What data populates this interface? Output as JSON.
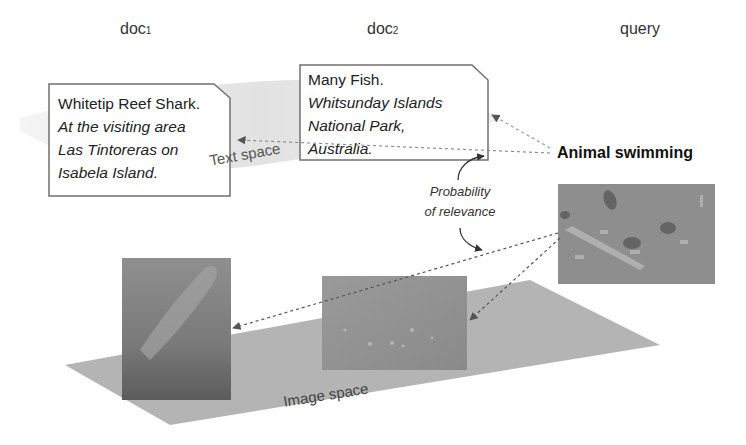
{
  "columns": {
    "doc1": {
      "label": "doc",
      "subscript": "1"
    },
    "doc2": {
      "label": "doc",
      "subscript": "2"
    },
    "query": {
      "label": "query"
    }
  },
  "doc1": {
    "title": "Whitetip Reef Shark.",
    "description_lines": [
      "At the visiting area",
      "Las Tintoreras on",
      "Isabela Island."
    ],
    "image": "shark-underwater-photo"
  },
  "doc2": {
    "title": "Many Fish.",
    "description_lines": [
      "Whitsunday Islands",
      "National Park,",
      "Australia."
    ],
    "image": "many-fish-underwater-photo"
  },
  "query": {
    "text": "Animal swimming",
    "image": "fish-swimming-photo"
  },
  "labels": {
    "text_space": "Text space",
    "image_space": "Image space",
    "probability_line1": "Probability",
    "probability_line2": "of relevance"
  },
  "colors": {
    "text_space_band": "#e6e6e6",
    "image_plane": "#b3b3b3",
    "box_border": "#666666",
    "arrow": "#777777"
  }
}
